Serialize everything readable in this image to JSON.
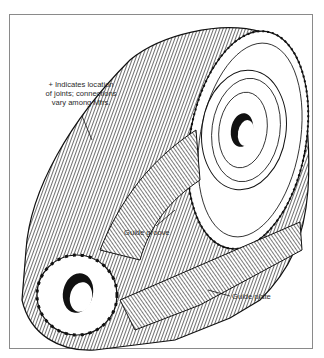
{
  "figure": {
    "labels": {
      "joints_note_line1": "+ Indicates location",
      "joints_note_line2": "of joints; connections",
      "joints_note_line3": "vary among Mfrs.",
      "guide_groove": "Guide groove",
      "guide_plate": "Guide plate"
    },
    "colors": {
      "ink": "#1a1a1a",
      "frame": "#8a8a8a",
      "background": "#ffffff"
    }
  }
}
